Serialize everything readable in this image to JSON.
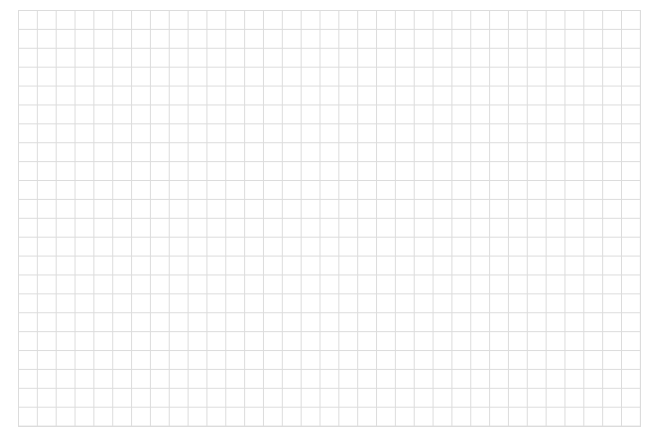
{
  "grid": {
    "columns": 33,
    "rows": 22,
    "line_color": "#dcdcdc",
    "background": "#ffffff"
  }
}
